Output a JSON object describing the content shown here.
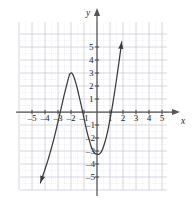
{
  "chart_data": {
    "type": "line",
    "title": "",
    "subtitle": "",
    "xlabel": "x",
    "ylabel": "y",
    "xlim": [
      -5.8,
      5.8
    ],
    "ylim": [
      -5.8,
      5.8
    ],
    "grid": true,
    "legend": null,
    "x_ticks": [
      -5,
      -4,
      -3,
      -2,
      -1,
      1,
      2,
      3,
      4,
      5
    ],
    "y_ticks": [
      5,
      4,
      3,
      2,
      1,
      -1,
      -2,
      -3,
      -4,
      -5
    ],
    "x_tick_labels": [
      "–5",
      "–4",
      "–3",
      "–2",
      "–1",
      "1",
      "2",
      "3",
      "4",
      "5"
    ],
    "y_tick_labels": [
      "5",
      "4",
      "3",
      "2",
      "1",
      "–1",
      "–2",
      "–3",
      "–4",
      "–5"
    ],
    "series": [
      {
        "name": "cubic-curve",
        "style": "solid",
        "color": "#3a3a3a",
        "arrow_start": true,
        "arrow_end": true,
        "roots": [
          -3.0,
          -1.05,
          1.2
        ],
        "local_max": [
          -2.05,
          3.0
        ],
        "local_min": [
          0.15,
          -3.25
        ],
        "y_intercept": -3.1,
        "points": [
          [
            -4.35,
            -5.45
          ],
          [
            -4.2,
            -5.0
          ],
          [
            -4.0,
            -4.4
          ],
          [
            -3.8,
            -3.8
          ],
          [
            -3.6,
            -3.1
          ],
          [
            -3.4,
            -2.4
          ],
          [
            -3.2,
            -1.6
          ],
          [
            -3.0,
            -0.75
          ],
          [
            -2.85,
            -0.1
          ],
          [
            -2.7,
            0.55
          ],
          [
            -2.55,
            1.2
          ],
          [
            -2.4,
            1.8
          ],
          [
            -2.25,
            2.4
          ],
          [
            -2.1,
            2.9
          ],
          [
            -2.0,
            3.0
          ],
          [
            -1.9,
            2.95
          ],
          [
            -1.8,
            2.75
          ],
          [
            -1.65,
            2.3
          ],
          [
            -1.5,
            1.75
          ],
          [
            -1.35,
            1.1
          ],
          [
            -1.2,
            0.45
          ],
          [
            -1.05,
            -0.25
          ],
          [
            -0.9,
            -0.95
          ],
          [
            -0.75,
            -1.6
          ],
          [
            -0.6,
            -2.15
          ],
          [
            -0.45,
            -2.65
          ],
          [
            -0.3,
            -3.0
          ],
          [
            -0.15,
            -3.2
          ],
          [
            0.0,
            -3.25
          ],
          [
            0.15,
            -3.25
          ],
          [
            0.3,
            -3.1
          ],
          [
            0.45,
            -2.8
          ],
          [
            0.6,
            -2.35
          ],
          [
            0.75,
            -1.8
          ],
          [
            0.9,
            -1.1
          ],
          [
            1.05,
            -0.3
          ],
          [
            1.2,
            0.55
          ],
          [
            1.35,
            1.5
          ],
          [
            1.5,
            2.5
          ],
          [
            1.65,
            3.55
          ],
          [
            1.8,
            4.65
          ],
          [
            1.9,
            5.4
          ]
        ]
      }
    ]
  },
  "axes": {
    "x_axis_label": "x",
    "y_axis_label": "y"
  }
}
